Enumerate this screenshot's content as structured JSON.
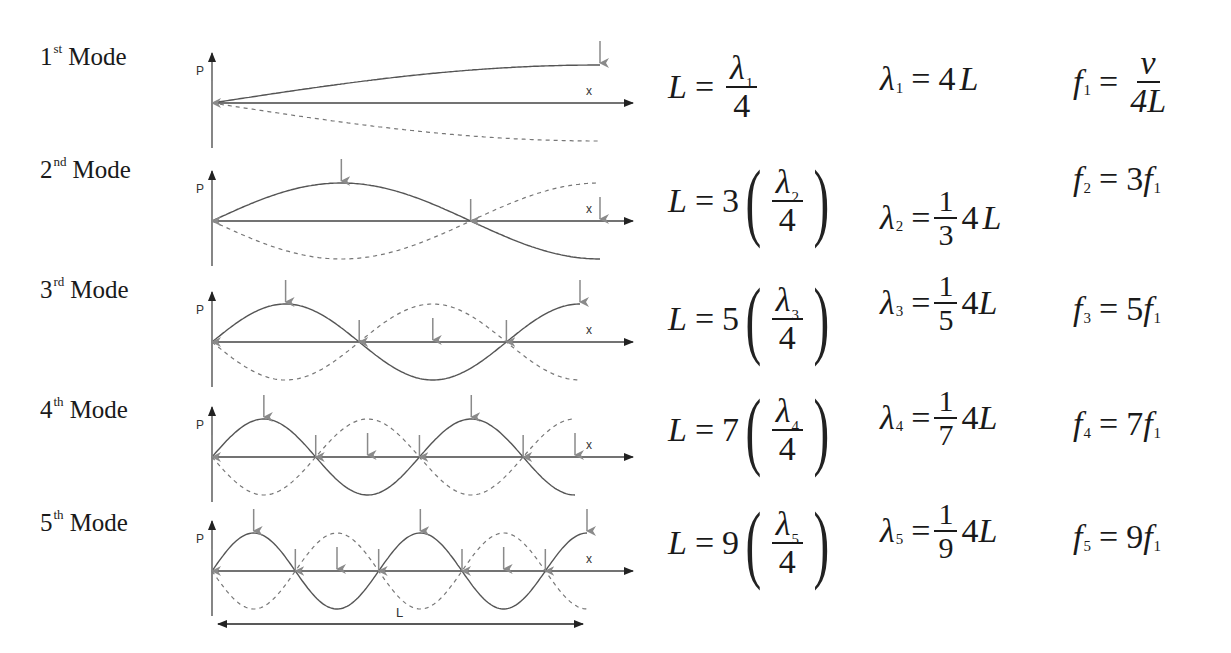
{
  "modes": [
    {
      "ordinal": "1",
      "suffix": "st",
      "word": "Mode",
      "eq1": {
        "lhs": "L",
        "eq": "=",
        "coef": "",
        "num_sym": "λ",
        "num_sub": "1",
        "den": "4",
        "parens": false
      },
      "eq2": {
        "lhs_sym": "λ",
        "lhs_sub": "1",
        "eq": "=",
        "frac_num": "",
        "frac_den": "",
        "rhs": "4",
        "rhs_var": "L"
      },
      "eq3": {
        "lhs_sym": "f",
        "lhs_sub": "1",
        "eq": "=",
        "num": "v",
        "den": "4L",
        "rhs": ""
      }
    },
    {
      "ordinal": "2",
      "suffix": "nd",
      "word": "Mode",
      "eq1": {
        "lhs": "L",
        "eq": "=",
        "coef": "3",
        "num_sym": "λ",
        "num_sub": "2",
        "den": "4",
        "parens": true
      },
      "eq2": {
        "lhs_sym": "λ",
        "lhs_sub": "2",
        "eq": "=",
        "frac_num": "1",
        "frac_den": "3",
        "rhs": "4",
        "rhs_var": "L"
      },
      "eq3": {
        "lhs_sym": "f",
        "lhs_sub": "2",
        "eq": "=",
        "coef": "3",
        "rhs_sym": "f",
        "rhs_sub": "1"
      }
    },
    {
      "ordinal": "3",
      "suffix": "rd",
      "word": "Mode",
      "eq1": {
        "lhs": "L",
        "eq": "=",
        "coef": "5",
        "num_sym": "λ",
        "num_sub": "3",
        "den": "4",
        "parens": true
      },
      "eq2": {
        "lhs_sym": "λ",
        "lhs_sub": "3",
        "eq": "=",
        "frac_num": "1",
        "frac_den": "5",
        "rhs": "4",
        "rhs_var": "L"
      },
      "eq3": {
        "lhs_sym": "f",
        "lhs_sub": "3",
        "eq": "=",
        "coef": "5",
        "rhs_sym": "f",
        "rhs_sub": "1"
      }
    },
    {
      "ordinal": "4",
      "suffix": "th",
      "word": "Mode",
      "eq1": {
        "lhs": "L",
        "eq": "=",
        "coef": "7",
        "num_sym": "λ",
        "num_sub": "4",
        "den": "4",
        "parens": true
      },
      "eq2": {
        "lhs_sym": "λ",
        "lhs_sub": "4",
        "eq": "=",
        "frac_num": "1",
        "frac_den": "7",
        "rhs": "4",
        "rhs_var": "L"
      },
      "eq3": {
        "lhs_sym": "f",
        "lhs_sub": "4",
        "eq": "=",
        "coef": "7",
        "rhs_sym": "f",
        "rhs_sub": "1"
      }
    },
    {
      "ordinal": "5",
      "suffix": "th",
      "word": "Mode",
      "eq1": {
        "lhs": "L",
        "eq": "=",
        "coef": "9",
        "num_sym": "λ",
        "num_sub": "5",
        "den": "4",
        "parens": true
      },
      "eq2": {
        "lhs_sym": "λ",
        "lhs_sub": "5",
        "eq": "=",
        "frac_num": "1",
        "frac_den": "9",
        "rhs": "4",
        "rhs_var": "L"
      },
      "eq3": {
        "lhs_sym": "f",
        "lhs_sub": "5",
        "eq": "=",
        "coef": "9",
        "rhs_sym": "f",
        "rhs_sub": "1"
      }
    }
  ],
  "axes": {
    "y_label": "P",
    "x_label": "x"
  },
  "length_label": "L",
  "colors": {
    "wave": "#555555",
    "dashed": "#777777",
    "axis": "#444444",
    "arrow": "#8a8a8a",
    "text": "#1a1a1a"
  },
  "chart_data": {
    "type": "line",
    "xlabel": "x",
    "ylabel": "P",
    "series": [
      {
        "name": "1st Mode",
        "quarter_wavelengths": 1,
        "wavelength": "4L",
        "frequency": "v/4L"
      },
      {
        "name": "2nd Mode",
        "quarter_wavelengths": 3,
        "wavelength": "(1/3)4L",
        "frequency": "3f1"
      },
      {
        "name": "3rd Mode",
        "quarter_wavelengths": 5,
        "wavelength": "(1/5)4L",
        "frequency": "5f1"
      },
      {
        "name": "4th Mode",
        "quarter_wavelengths": 7,
        "wavelength": "(1/7)4L",
        "frequency": "7f1"
      },
      {
        "name": "5th Mode",
        "quarter_wavelengths": 9,
        "wavelength": "(1/9)4L",
        "frequency": "9f1"
      }
    ],
    "annotations": [
      "solid line = pressure at one instant",
      "dashed line = pressure half a period later",
      "grey arrows mark nodes and antinodes",
      "L = tube length"
    ]
  }
}
